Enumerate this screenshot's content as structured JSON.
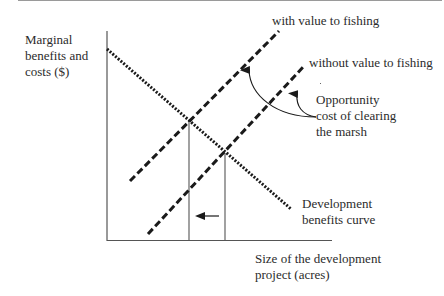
{
  "diagram": {
    "title": "",
    "y_axis_label": [
      "Marginal",
      "benefits and",
      "costs ($)"
    ],
    "x_axis_label": [
      "Size of the development",
      "project (acres)"
    ],
    "curves": {
      "with_value": {
        "label": "with value to fishing",
        "style": "dashed",
        "from": [
          130,
          181
        ],
        "to": [
          279,
          31
        ]
      },
      "without_value": {
        "label": "without value to fishing",
        "style": "dashed",
        "from": [
          148,
          234
        ],
        "to": [
          305,
          65
        ]
      },
      "development_benefits": {
        "label": [
          "Development",
          "benefits curve"
        ],
        "style": "dotted",
        "from": [
          107,
          49
        ],
        "to": [
          291,
          209
        ]
      }
    },
    "annotation": {
      "label": [
        "Opportunity",
        "cost of clearing",
        "the marsh"
      ]
    },
    "intersections": [
      [
        189,
        120
      ],
      [
        225,
        153
      ]
    ],
    "shift_arrow": {
      "direction": "left"
    },
    "colors": {
      "line": "#1a1a1a",
      "axis": "#555555",
      "text": "#2b2b2b"
    }
  }
}
